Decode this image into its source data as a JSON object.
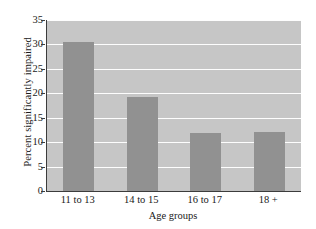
{
  "chart_data": {
    "type": "bar",
    "title": "",
    "xlabel": "Age groups",
    "ylabel": "Percent significantly impaired",
    "categories": [
      "11 to 13",
      "14 to 15",
      "16 to 17",
      "18 +"
    ],
    "values": [
      30.5,
      19.2,
      11.8,
      12.0
    ],
    "ylim": [
      0,
      35
    ],
    "yticks": [
      0,
      5,
      10,
      15,
      20,
      25,
      30,
      35
    ],
    "ytick_labels": [
      "0",
      "5",
      "10",
      "15",
      "20",
      "25",
      "30",
      "35"
    ],
    "grid": "horizontal-white",
    "legend": "none",
    "colors": {
      "bar": "#919191",
      "plot_background": "#c6c6c6",
      "gridline": "#fdfdfd",
      "axis": "#3c3c3c",
      "figure_background": "#ffffff",
      "text": "#1a1a1a"
    }
  }
}
